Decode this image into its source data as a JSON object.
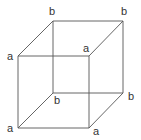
{
  "diagram": {
    "type": "cube-wireframe",
    "line_color": "#555555",
    "label_color": "#333333",
    "vertices": {
      "back_top_left": {
        "x": 53,
        "y": 21,
        "label": "b"
      },
      "back_top_right": {
        "x": 123,
        "y": 21,
        "label": "b"
      },
      "back_bottom_left": {
        "x": 53,
        "y": 93,
        "label": "b"
      },
      "back_bottom_right": {
        "x": 123,
        "y": 93,
        "label": "b"
      },
      "front_top_left": {
        "x": 18,
        "y": 56,
        "label": "a"
      },
      "front_top_right": {
        "x": 89,
        "y": 56,
        "label": "a"
      },
      "front_bottom_left": {
        "x": 18,
        "y": 128,
        "label": "a"
      },
      "front_bottom_right": {
        "x": 89,
        "y": 128,
        "label": "a"
      }
    },
    "labels": [
      {
        "id": "back_top_left",
        "text": "b",
        "x": 49,
        "y": 15
      },
      {
        "id": "back_top_right",
        "text": "b",
        "x": 121,
        "y": 15
      },
      {
        "id": "back_bottom_left",
        "text": "b",
        "x": 54,
        "y": 104
      },
      {
        "id": "back_bottom_right",
        "text": "b",
        "x": 128,
        "y": 100
      },
      {
        "id": "front_top_left",
        "text": "a",
        "x": 7,
        "y": 60
      },
      {
        "id": "front_top_right",
        "text": "a",
        "x": 83,
        "y": 52
      },
      {
        "id": "front_bottom_left",
        "text": "a",
        "x": 7,
        "y": 132
      },
      {
        "id": "front_bottom_right",
        "text": "a",
        "x": 93,
        "y": 135
      }
    ]
  }
}
